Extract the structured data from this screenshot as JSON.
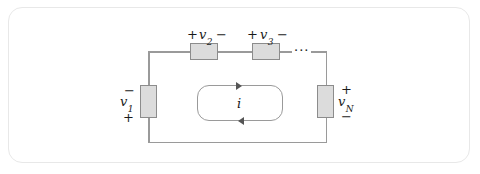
{
  "figure": {
    "type": "series-circuit-loop"
  },
  "elements": {
    "v1": {
      "label": "v",
      "subscript": "1",
      "polarity_top": "−",
      "polarity_bottom": "+",
      "orientation": "vertical",
      "position": "left"
    },
    "v2": {
      "label": "v",
      "subscript": "2",
      "polarity_left": "+",
      "polarity_right": "−",
      "orientation": "horizontal",
      "position": "top"
    },
    "v3": {
      "label": "v",
      "subscript": "3",
      "polarity_left": "+",
      "polarity_right": "−",
      "orientation": "horizontal",
      "position": "top"
    },
    "vN": {
      "label": "v",
      "subscript": "N",
      "polarity_top": "+",
      "polarity_bottom": "−",
      "orientation": "vertical",
      "position": "right"
    }
  },
  "continuation": {
    "ellipsis": "···"
  },
  "current": {
    "label": "i",
    "direction": "clockwise"
  },
  "colors": {
    "wire": "#9a9a9a",
    "box_fill": "#dcdcdc",
    "box_border": "#8c8c8c",
    "frame_border": "#e8e8e8",
    "text": "#1a1a1a",
    "background": "#ffffff"
  }
}
